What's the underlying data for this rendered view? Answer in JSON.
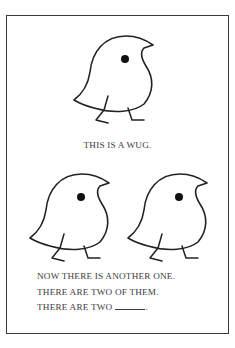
{
  "figure": {
    "caption_single": "THIS IS A WUG.",
    "caption_plural": [
      "NOW THERE IS ANOTHER ONE.",
      "THERE ARE TWO OF THEM.",
      "THERE ARE TWO"
    ],
    "blank_end": ".",
    "icons": [
      "wug-bird-icon",
      "wug-bird-icon",
      "wug-bird-icon"
    ],
    "colors": {
      "ink": "#222222",
      "text": "#3c3c3c",
      "background": "#ffffff"
    }
  }
}
